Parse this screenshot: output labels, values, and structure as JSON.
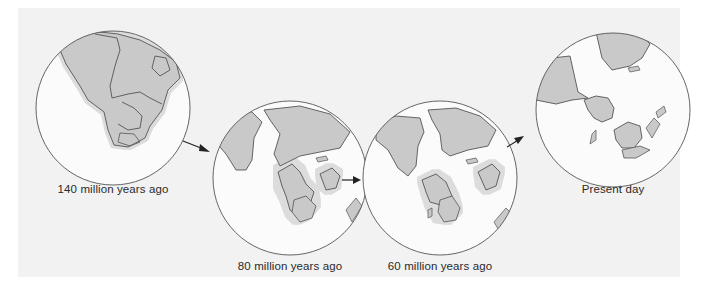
{
  "figure": {
    "colors": {
      "background": "#f2f2f2",
      "ocean": "#fbfbfb",
      "land": "#c9c9c9",
      "shelf_halo": "#dcdcdc",
      "outline": "#555555",
      "arrow": "#222222"
    },
    "panels": [
      {
        "id": "p140",
        "label": "140 million years ago",
        "cx": 113,
        "cy": 108,
        "r": 77,
        "label_x": 113,
        "label_y": 183
      },
      {
        "id": "p80",
        "label": "80 million years ago",
        "cx": 290,
        "cy": 178,
        "r": 77,
        "label_x": 290,
        "label_y": 260
      },
      {
        "id": "p60",
        "label": "60 million years ago",
        "cx": 440,
        "cy": 178,
        "r": 77,
        "label_x": 440,
        "label_y": 260
      },
      {
        "id": "ppd",
        "label": "Present day",
        "cx": 613,
        "cy": 110,
        "r": 77,
        "label_x": 613,
        "label_y": 183
      }
    ],
    "arrows": [
      {
        "from": "140 million years ago",
        "to": "80 million years ago"
      },
      {
        "from": "80 million years ago",
        "to": "60 million years ago"
      },
      {
        "from": "60 million years ago",
        "to": "Present day"
      }
    ]
  }
}
